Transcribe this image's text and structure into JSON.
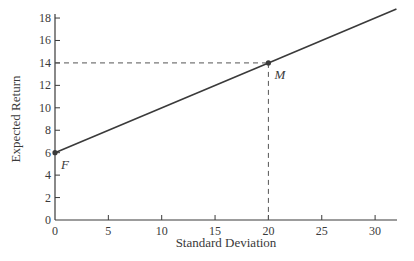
{
  "chart_data": {
    "type": "line",
    "title": "",
    "xlabel": "Standard Deviation",
    "ylabel": "Expected Return",
    "xlim": [
      0,
      32
    ],
    "ylim": [
      0,
      19
    ],
    "xticks": [
      0,
      5,
      10,
      15,
      20,
      25,
      30
    ],
    "yticks": [
      0,
      2,
      4,
      6,
      8,
      10,
      12,
      14,
      16,
      18
    ],
    "grid": false,
    "legend": null,
    "series": [
      {
        "name": "Capital Market Line",
        "x": [
          0,
          20,
          32
        ],
        "y": [
          6,
          14,
          18.8
        ]
      }
    ],
    "points": [
      {
        "label": "F",
        "x": 0,
        "y": 6
      },
      {
        "label": "M",
        "x": 20,
        "y": 14
      }
    ],
    "reference_lines": [
      {
        "type": "horizontal-dashed",
        "y": 14,
        "from_x": 0,
        "to_x": 20
      },
      {
        "type": "vertical-dashed",
        "x": 20,
        "from_y": 0,
        "to_y": 14
      }
    ]
  },
  "colors": {
    "ink": "#3a3a3a",
    "dashed": "#555555"
  }
}
